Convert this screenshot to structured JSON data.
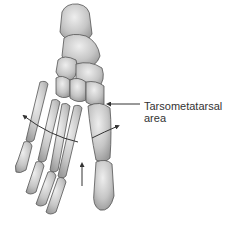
{
  "diagram": {
    "annotation": {
      "line1": "Tarsometatarsal",
      "line2": "area"
    },
    "colors": {
      "bone_fill": "#c9c9c9",
      "bone_stroke": "#555555",
      "arrow": "#333333",
      "background": "#ffffff"
    }
  }
}
